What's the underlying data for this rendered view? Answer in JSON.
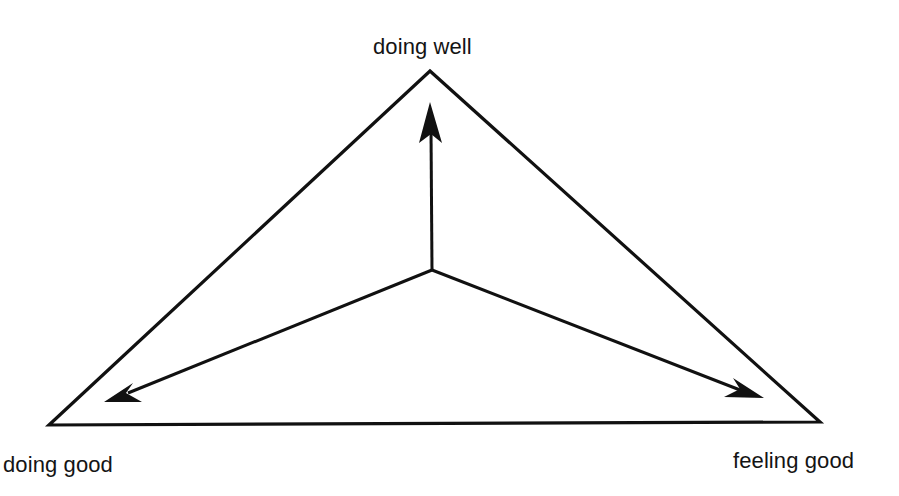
{
  "diagram": {
    "type": "triangle-with-radiating-arrows",
    "stroke_color": "#111111",
    "background_color": "#ffffff",
    "vertices": {
      "top": {
        "label": "doing well"
      },
      "bottom_left": {
        "label": "doing good"
      },
      "bottom_right": {
        "label": "feeling good"
      }
    },
    "arrows": [
      {
        "from": "center",
        "to": "top",
        "target_label": "doing well"
      },
      {
        "from": "center",
        "to": "bottom_left",
        "target_label": "doing good"
      },
      {
        "from": "center",
        "to": "bottom_right",
        "target_label": "feeling good"
      }
    ]
  }
}
